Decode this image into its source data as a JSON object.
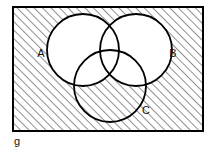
{
  "figure": {
    "kind": "venn-diagram",
    "set_count": 3,
    "universe_label": "g",
    "stroke_color": "#000000",
    "fill_color": "#ffffff",
    "hatch_color": "#333333",
    "background_color": "#ffffff",
    "hatch_angle_degrees": 45,
    "hatch_spacing_px": 6,
    "shaded_description": "everything outside A and B, inside the universal set",
    "sets": [
      {
        "id": "A",
        "label": "A",
        "cx": 83,
        "cy": 50,
        "r": 36,
        "label_x": 41,
        "label_y": 54,
        "shaded": false
      },
      {
        "id": "B",
        "label": "B",
        "cx": 136,
        "cy": 50,
        "r": 36,
        "label_x": 173,
        "label_y": 54,
        "shaded": false
      },
      {
        "id": "C",
        "label": "C",
        "cx": 110,
        "cy": 86,
        "r": 36,
        "label_x": 146,
        "label_y": 111,
        "shaded": true
      }
    ],
    "universe": {
      "x": 13,
      "y": 7,
      "width": 190,
      "height": 124,
      "label_x": 14,
      "label_y": 145
    }
  }
}
